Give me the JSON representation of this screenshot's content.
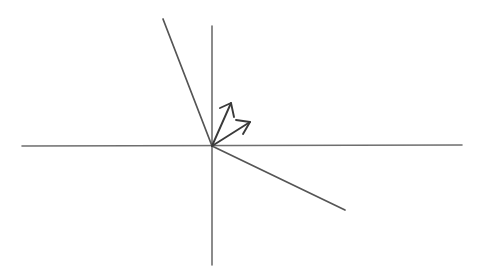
{
  "figure": {
    "background_color": "#ffffff",
    "width": 486,
    "height": 278,
    "origin": {
      "x": 212,
      "y": 146
    }
  },
  "style": {
    "axis_color": "#6e6e6e",
    "line_color": "#555555",
    "vector_color": "#3a3a3a",
    "axis_stroke_width": 1.6,
    "line_stroke_width": 1.7,
    "vector_stroke_width": 1.9
  },
  "axes": [
    {
      "name": "horizontal-axis",
      "label": "x-axis",
      "x1": 22,
      "y1": 146,
      "x2": 462,
      "y2": 145
    },
    {
      "name": "vertical-axis",
      "label": "y-axis",
      "x1": 212,
      "y1": 26,
      "x2": 212,
      "y2": 265
    }
  ],
  "lines": [
    {
      "name": "steep-line",
      "label": "Steep line through origin (upper-left to origin)",
      "x1": 163,
      "y1": 19,
      "x2": 212,
      "y2": 146,
      "slope_description": "negative, steep"
    },
    {
      "name": "shallow-line",
      "label": "Shallow line through origin (origin to lower-right)",
      "x1": 212,
      "y1": 146,
      "x2": 345,
      "y2": 210,
      "slope_description": "negative, shallow"
    }
  ],
  "vectors": [
    {
      "name": "vector-upper",
      "label": "Upper vector arrow",
      "from": {
        "x": 212,
        "y": 146
      },
      "to": {
        "x": 231,
        "y": 103
      },
      "head_left": {
        "x": 220,
        "y": 108
      },
      "head_right": {
        "x": 234,
        "y": 117
      },
      "angle_degrees": 66
    },
    {
      "name": "vector-lower",
      "label": "Lower vector arrow",
      "from": {
        "x": 212,
        "y": 146
      },
      "to": {
        "x": 250,
        "y": 122
      },
      "head_left": {
        "x": 236,
        "y": 120
      },
      "head_right": {
        "x": 243,
        "y": 134
      },
      "angle_degrees": 32
    }
  ]
}
